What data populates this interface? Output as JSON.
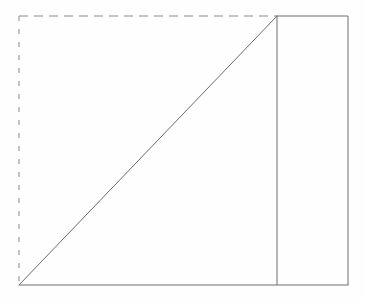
{
  "figure": {
    "title": "Right triangle inscribed in a dashed rectangle with adjacent solid rectangle",
    "canvas": {
      "width": 365,
      "height": 302,
      "background": "#fefefe"
    },
    "colors": {
      "stroke": "#6e6e6e",
      "stroke_dashed": "#8a8a8a",
      "diagonal": "#6a6a6a",
      "background": "#fefefe"
    },
    "geometry": {
      "left": 19,
      "top": 16,
      "right": 348,
      "bottom": 285,
      "divider_x": 277,
      "stroke_width": 1,
      "dash_top": "9 6",
      "dash_left": "5 8"
    },
    "vertices": {
      "top_left": "19,16",
      "top_apex": "277,16",
      "top_right": "348,16",
      "bottom_left": "19,285",
      "bottom_divider": "277,285",
      "bottom_right": "348,285"
    },
    "edges": {
      "top_dashed": {
        "x1": 19,
        "y1": 16,
        "x2": 277,
        "y2": 16,
        "style": "dashed"
      },
      "top_solid": {
        "x1": 277,
        "y1": 16,
        "x2": 348,
        "y2": 16,
        "style": "solid"
      },
      "left_dashed": {
        "x1": 19,
        "y1": 16,
        "x2": 19,
        "y2": 285,
        "style": "dashed"
      },
      "right_solid": {
        "x1": 348,
        "y1": 16,
        "x2": 348,
        "y2": 285,
        "style": "solid"
      },
      "bottom_solid": {
        "x1": 19,
        "y1": 285,
        "x2": 348,
        "y2": 285,
        "style": "solid"
      },
      "divider_solid": {
        "x1": 277,
        "y1": 16,
        "x2": 277,
        "y2": 285,
        "style": "solid"
      },
      "hypotenuse": {
        "x1": 19,
        "y1": 285,
        "x2": 277,
        "y2": 16,
        "style": "solid"
      }
    }
  }
}
